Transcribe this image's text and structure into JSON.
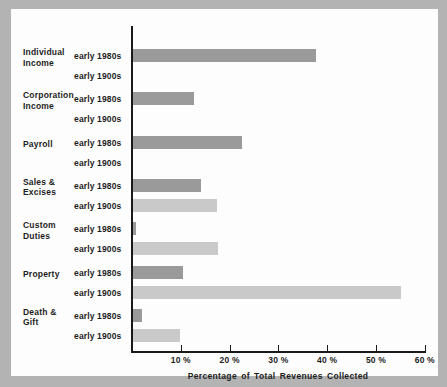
{
  "chart_data": {
    "type": "bar",
    "orientation": "horizontal",
    "title": "",
    "xlabel": "Percentage of Total Revenues Collected",
    "ylabel": "",
    "xlim": [
      0,
      60
    ],
    "xticks": [
      0,
      10,
      20,
      30,
      40,
      50,
      60
    ],
    "xtick_labels": [
      "",
      "10 %",
      "20 %",
      "30 %",
      "40 %",
      "50 %",
      "60 %"
    ],
    "grid": false,
    "legend_position": "none",
    "categories": [
      "Individual Income",
      "Corporation Income",
      "Payroll",
      "Sales & Excises",
      "Custom Duties",
      "Property",
      "Death & Gift"
    ],
    "series": [
      {
        "name": "early 1980s",
        "color": "#9a9a9a",
        "values": [
          37.4,
          12.5,
          22.4,
          14.0,
          0.6,
          10.3,
          1.8
        ]
      },
      {
        "name": "early 1900s",
        "color": "#c9c9c9",
        "values": [
          0.0,
          0.0,
          0.0,
          17.3,
          17.5,
          55.0,
          9.7
        ]
      }
    ]
  },
  "categories_display": [
    {
      "line1": "Individual",
      "line2": "Income"
    },
    {
      "line1": "Corporation",
      "line2": "Income"
    },
    {
      "line1": "Payroll",
      "line2": ""
    },
    {
      "line1": "Sales &",
      "line2": "Excises"
    },
    {
      "line1": "Custom",
      "line2": "Duties"
    },
    {
      "line1": "Property",
      "line2": ""
    },
    {
      "line1": "Death &",
      "line2": "Gift"
    }
  ],
  "series_labels": {
    "s1980": "early 1980s",
    "s1900": "early 1900s"
  },
  "axis": {
    "title": "Percentage of Total Revenues Collected",
    "tick_0": "",
    "tick_10": "10 %",
    "tick_20": "20 %",
    "tick_30": "30 %",
    "tick_40": "40 %",
    "tick_50": "50 %",
    "tick_60": "60 %"
  },
  "colors": {
    "bar_1980s": "#9a9a9a",
    "bar_1900s": "#c9c9c9",
    "panel_background": "#fdfdfd",
    "page_background": "#b3b3b3",
    "axis": "#1a1a1a",
    "text": "#1d1d1d"
  }
}
